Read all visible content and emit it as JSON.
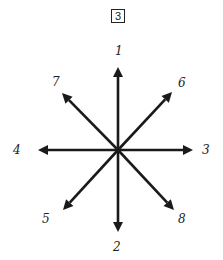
{
  "figure": {
    "box_label": "3",
    "center": {
      "x": 118,
      "y": 150
    },
    "stroke_color": "#1a1a1a",
    "arrows": [
      {
        "id": "1",
        "label": "1",
        "tip": {
          "x": 118,
          "y": 67
        },
        "label_pos": {
          "x": 115,
          "y": 45
        }
      },
      {
        "id": "2",
        "label": "2",
        "tip": {
          "x": 118,
          "y": 232
        },
        "label_pos": {
          "x": 113,
          "y": 241
        }
      },
      {
        "id": "3",
        "label": "3",
        "tip": {
          "x": 193,
          "y": 150
        },
        "label_pos": {
          "x": 202,
          "y": 144
        }
      },
      {
        "id": "4",
        "label": "4",
        "tip": {
          "x": 38,
          "y": 150
        },
        "label_pos": {
          "x": 13,
          "y": 144
        }
      },
      {
        "id": "5",
        "label": "5",
        "tip": {
          "x": 63,
          "y": 210
        },
        "label_pos": {
          "x": 42,
          "y": 213
        }
      },
      {
        "id": "6",
        "label": "6",
        "tip": {
          "x": 172,
          "y": 92
        },
        "label_pos": {
          "x": 178,
          "y": 77
        }
      },
      {
        "id": "7",
        "label": "7",
        "tip": {
          "x": 62,
          "y": 93
        },
        "label_pos": {
          "x": 52,
          "y": 76
        }
      },
      {
        "id": "8",
        "label": "8",
        "tip": {
          "x": 174,
          "y": 210
        },
        "label_pos": {
          "x": 178,
          "y": 213
        }
      }
    ]
  }
}
